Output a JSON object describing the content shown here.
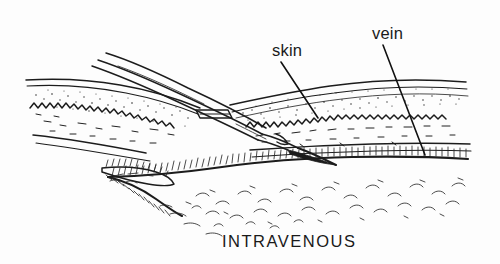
{
  "figure": {
    "kind": "medical-line-drawing",
    "title_caption": "INTRAVENOUS",
    "background_color": "#fdfdfd",
    "ink_color": "#1c1c1c",
    "labels": [
      {
        "id": "skin",
        "text": "skin",
        "x": 272,
        "y": 56
      },
      {
        "id": "vein",
        "text": "vein",
        "x": 372,
        "y": 39
      }
    ],
    "leaders": [
      {
        "id": "skin-leader",
        "from_x": 281,
        "from_y": 62,
        "to_x": 318,
        "to_y": 118
      },
      {
        "id": "vein-leader",
        "from_x": 383,
        "from_y": 45,
        "to_x": 425,
        "to_y": 155
      }
    ],
    "caption": {
      "text": "INTRAVENOUS",
      "x": 222,
      "y": 247
    },
    "parts": [
      {
        "name": "needle-shaft",
        "description": "hypodermic needle entering from upper left"
      },
      {
        "name": "needle-bevel-tip",
        "description": "dark beveled needle tip inside vein"
      },
      {
        "name": "epidermis",
        "description": "thin paired surface lines of skin"
      },
      {
        "name": "dermis",
        "description": "stippled dotted band beneath epidermis"
      },
      {
        "name": "dermis-wave",
        "description": "wavy zigzag boundary line"
      },
      {
        "name": "subcutaneous-tissue",
        "description": "fat tissue drawn with c-shaped squiggles"
      },
      {
        "name": "vein-wall",
        "description": "hatched vein wall below skin"
      },
      {
        "name": "vein-branch",
        "description": "pointed leaf-shaped vein branch at left"
      }
    ]
  }
}
